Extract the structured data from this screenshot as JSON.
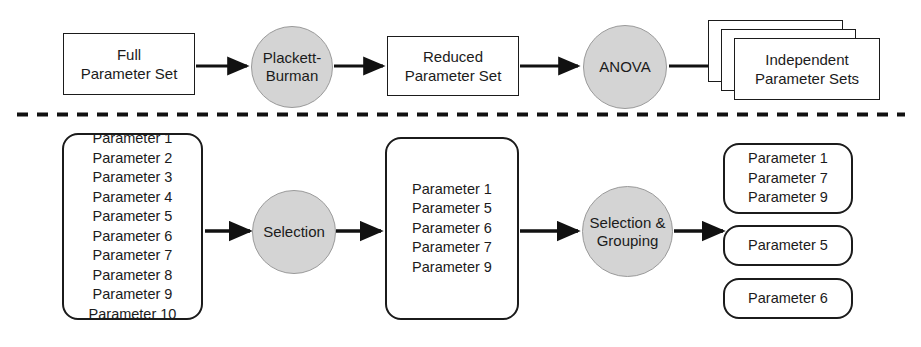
{
  "figure": {
    "divider": "dashed-horizontal-separator",
    "colors": {
      "stroke": "#1b1b1b",
      "circle_fill": "#d4d4d4",
      "background": "#ffffff"
    }
  },
  "top_flow": {
    "full_parameter_set": {
      "line1": "Full",
      "line2": "Parameter Set"
    },
    "plackett_burman": {
      "line1": "Plackett-",
      "line2": "Burman"
    },
    "reduced_parameter_set": {
      "line1": "Reduced",
      "line2": "Parameter Set"
    },
    "anova": {
      "line1": "ANOVA"
    },
    "independent_parameter_sets": {
      "line1": "Independent",
      "line2": "Parameter Sets",
      "stack_count": 3
    }
  },
  "bottom_flow": {
    "input_list": {
      "items": [
        "Parameter 1",
        "Parameter 2",
        "Parameter 3",
        "Parameter 4",
        "Parameter 5",
        "Parameter 6",
        "Parameter 7",
        "Parameter 8",
        "Parameter 9",
        "Parameter 10"
      ]
    },
    "selection": {
      "line1": "Selection"
    },
    "reduced_list": {
      "items": [
        "Parameter 1",
        "Parameter 5",
        "Parameter 6",
        "Parameter 7",
        "Parameter 9"
      ]
    },
    "selection_grouping": {
      "line1": "Selection &",
      "line2": "Grouping"
    },
    "groups": [
      {
        "items": [
          "Parameter 1",
          "Parameter 7",
          "Parameter 9"
        ]
      },
      {
        "items": [
          "Parameter 5"
        ]
      },
      {
        "items": [
          "Parameter 6"
        ]
      }
    ]
  }
}
